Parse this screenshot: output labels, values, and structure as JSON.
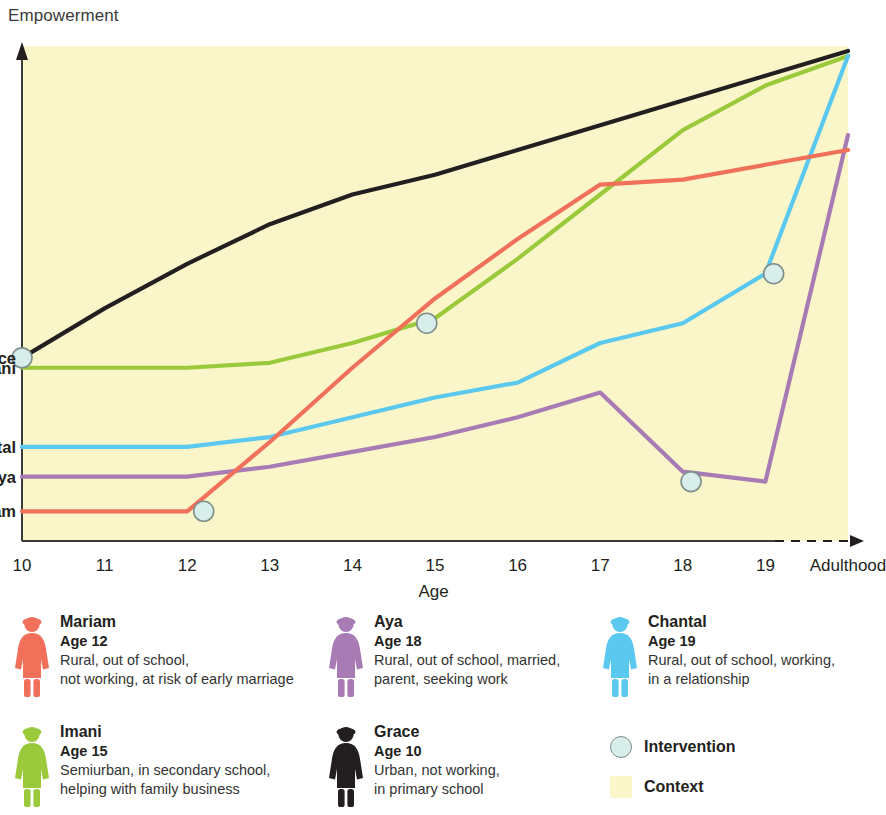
{
  "axis": {
    "y_title": "Empowerment",
    "x_title": "Age",
    "x_ticks": [
      "10",
      "11",
      "12",
      "13",
      "14",
      "15",
      "16",
      "17",
      "18",
      "19",
      "Adulthood"
    ]
  },
  "series_labels": {
    "grace": "Grace",
    "imani": "Imani",
    "chantal": "Chantal",
    "aya": "Aya",
    "mariam": "Mariam"
  },
  "colors": {
    "grace": "#231f20",
    "imani": "#9ACA3C",
    "chantal": "#5BC8EF",
    "aya": "#A87BB5",
    "mariam": "#F0705A",
    "context": "#FBF6C9",
    "intervention_fill": "#D7EEEA",
    "intervention_stroke": "#7F8F8B"
  },
  "legend": {
    "people": [
      {
        "name": "Mariam",
        "age": "Age 12",
        "desc_line1": "Rural, out of school,",
        "desc_line2": "not working, at risk of early marriage",
        "color": "#F0705A",
        "icon": "female-figure-icon"
      },
      {
        "name": "Aya",
        "age": "Age 18",
        "desc_line1": "Rural, out of school, married,",
        "desc_line2": "parent, seeking work",
        "color": "#A87BB5",
        "icon": "female-figure-icon"
      },
      {
        "name": "Chantal",
        "age": "Age 19",
        "desc_line1": "Rural, out of school, working,",
        "desc_line2": "in a relationship",
        "color": "#5BC8EF",
        "icon": "female-figure-icon"
      },
      {
        "name": "Imani",
        "age": "Age 15",
        "desc_line1": "Semiurban, in secondary school,",
        "desc_line2": "helping with family business",
        "color": "#9ACA3C",
        "icon": "female-figure-icon"
      },
      {
        "name": "Grace",
        "age": "Age 10",
        "desc_line1": "Urban, not working,",
        "desc_line2": "in primary school",
        "color": "#231f20",
        "icon": "female-figure-icon"
      }
    ],
    "keys": [
      {
        "label": "Intervention",
        "icon": "intervention-circle-icon"
      },
      {
        "label": "Context",
        "icon": "context-swatch-icon"
      }
    ]
  },
  "chart_data": {
    "type": "line",
    "title": "",
    "xlabel": "Age",
    "ylabel": "Empowerment",
    "x": [
      10,
      11,
      12,
      13,
      14,
      15,
      16,
      17,
      18,
      19,
      20
    ],
    "x_tick_labels": [
      "10",
      "11",
      "12",
      "13",
      "14",
      "15",
      "16",
      "17",
      "18",
      "19",
      "Adulthood"
    ],
    "xlim": [
      10,
      20
    ],
    "ylim": [
      0,
      100
    ],
    "grid": false,
    "legend_position": "below-plot",
    "y_axis_scale": "qualitative (low to high empowerment, unlabeled)",
    "series": [
      {
        "name": "Grace",
        "color": "#231f20",
        "label_at_start": true,
        "values": [
          37,
          47,
          56,
          64,
          70,
          74,
          79,
          84,
          89,
          94,
          99
        ],
        "interventions": [
          {
            "x": 10,
            "y": 37
          }
        ]
      },
      {
        "name": "Imani",
        "color": "#9ACA3C",
        "label_at_start": true,
        "values": [
          35,
          35,
          35,
          36,
          40,
          45,
          57,
          70,
          83,
          92,
          98
        ],
        "interventions": [
          {
            "x": 14.9,
            "y": 44
          }
        ]
      },
      {
        "name": "Chantal",
        "color": "#5BC8EF",
        "label_at_start": true,
        "values": [
          19,
          19,
          19,
          21,
          25,
          29,
          32,
          40,
          44,
          54,
          98
        ],
        "interventions": [
          {
            "x": 19.1,
            "y": 54
          }
        ]
      },
      {
        "name": "Aya",
        "color": "#A87BB5",
        "label_at_start": true,
        "values": [
          13,
          13,
          13,
          15,
          18,
          21,
          25,
          30,
          14,
          12,
          82
        ],
        "interventions": [
          {
            "x": 18.1,
            "y": 12
          }
        ]
      },
      {
        "name": "Mariam",
        "color": "#F0705A",
        "label_at_start": true,
        "values": [
          6,
          6,
          6,
          20,
          35,
          49,
          61,
          72,
          73,
          76,
          79
        ],
        "interventions": [
          {
            "x": 12.2,
            "y": 6
          }
        ]
      }
    ]
  }
}
